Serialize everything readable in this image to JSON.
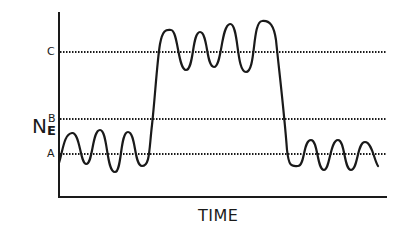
{
  "diagram": {
    "type": "schematic waveform",
    "y_axis_label": {
      "main": "N",
      "subscript": "E"
    },
    "x_axis_label": "TIME",
    "levels": [
      {
        "id": "C",
        "label": "C",
        "y": 52
      },
      {
        "id": "B",
        "label": "B",
        "y": 119
      },
      {
        "id": "A",
        "label": "A",
        "y": 154
      }
    ],
    "colors": {
      "line": "#1a1a1a",
      "background": "#ffffff"
    },
    "waveform": {
      "description": "Signal oscillates around level A, rises sharply past B to oscillate around level C, then falls back to oscillate around level A",
      "segments": [
        {
          "level": "A",
          "oscillations": 3,
          "x_range": [
            59,
            150
          ]
        },
        {
          "transition": "rise",
          "from": "A",
          "to": "C",
          "x_range": [
            150,
            162
          ]
        },
        {
          "level": "C",
          "oscillations": 4,
          "x_range": [
            162,
            285
          ]
        },
        {
          "transition": "fall",
          "from": "C",
          "to": "A",
          "x_range": [
            285,
            292
          ]
        },
        {
          "level": "A",
          "oscillations": 3,
          "x_range": [
            292,
            378
          ]
        }
      ]
    }
  }
}
